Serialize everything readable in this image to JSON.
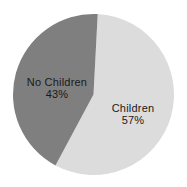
{
  "chart_data": {
    "type": "pie",
    "categories": [
      "Children",
      "No Children"
    ],
    "values": [
      57,
      43
    ],
    "slices": [
      {
        "label": "Children",
        "value": 57,
        "pct_label": "57%",
        "color": "#dcdcdc"
      },
      {
        "label": "No Children",
        "value": 43,
        "pct_label": "43%",
        "color": "#7f7f7f"
      }
    ],
    "start_angle_deg": 3,
    "direction": "clockwise",
    "label_position": "inside",
    "legend": "none",
    "background_color": "#ffffff",
    "text_color": "#1a1a1a"
  }
}
